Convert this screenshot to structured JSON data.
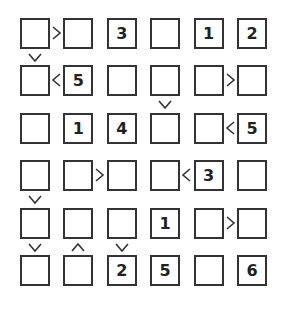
{
  "puzzle": {
    "type": "futoshiki",
    "size": 6,
    "grid": [
      [
        "",
        "",
        "3",
        "",
        "1",
        "2"
      ],
      [
        "",
        "5",
        "",
        "",
        "",
        ""
      ],
      [
        "",
        "1",
        "4",
        "",
        "",
        "5"
      ],
      [
        "",
        "",
        "",
        "",
        "3",
        ""
      ],
      [
        "",
        "",
        "",
        "1",
        "",
        ""
      ],
      [
        "",
        "",
        "2",
        "5",
        "",
        "6"
      ]
    ],
    "horizontal_constraints": [
      {
        "row": 0,
        "col": 0,
        "sign": ">"
      },
      {
        "row": 1,
        "col": 0,
        "sign": "<"
      },
      {
        "row": 1,
        "col": 4,
        "sign": ">"
      },
      {
        "row": 2,
        "col": 4,
        "sign": "<"
      },
      {
        "row": 3,
        "col": 1,
        "sign": ">"
      },
      {
        "row": 3,
        "col": 3,
        "sign": "<"
      },
      {
        "row": 4,
        "col": 4,
        "sign": ">"
      }
    ],
    "vertical_constraints": [
      {
        "row": 0,
        "col": 0,
        "sign": "v"
      },
      {
        "row": 1,
        "col": 3,
        "sign": "v"
      },
      {
        "row": 3,
        "col": 0,
        "sign": "v"
      },
      {
        "row": 4,
        "col": 0,
        "sign": "v"
      },
      {
        "row": 4,
        "col": 1,
        "sign": "^"
      },
      {
        "row": 4,
        "col": 2,
        "sign": "v"
      }
    ]
  }
}
